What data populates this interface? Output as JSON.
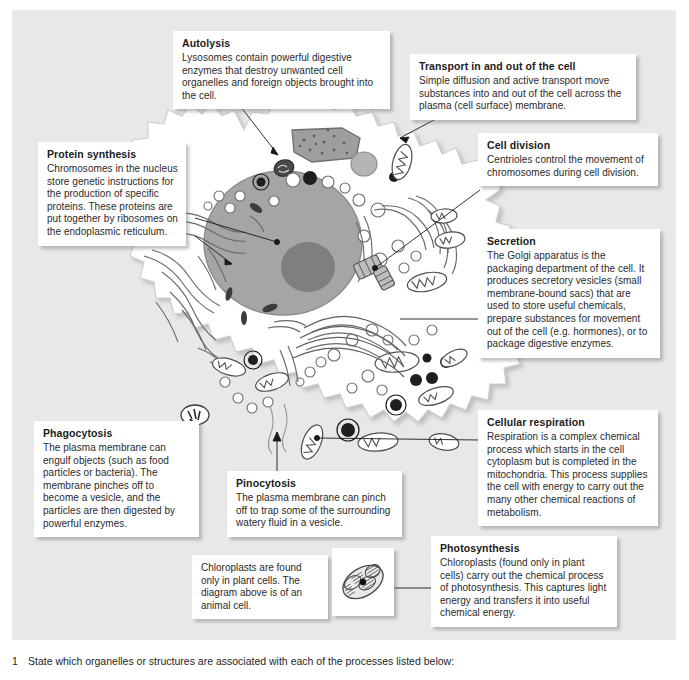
{
  "figure": {
    "background_color": "#e8e8e8",
    "callout_bg": "#ffffff",
    "cell_fill": "#ffffff",
    "nucleus_color": "#9a9a9a",
    "nucleolus_color": "#777777",
    "organelle_outline": "#4a4a4a"
  },
  "callouts": [
    {
      "id": "autolysis",
      "title": "Autolysis",
      "body": "Lysosomes contain powerful digestive enzymes that destroy unwanted cell organelles and foreign objects brought into the cell."
    },
    {
      "id": "transport",
      "title": "Transport in and out of the cell",
      "body": "Simple diffusion and active transport move substances into and out of the cell across the plasma (cell surface) membrane."
    },
    {
      "id": "protein-synthesis",
      "title": "Protein synthesis",
      "body": "Chromosomes in the nucleus store genetic instructions for the production of specific proteins. These proteins are put together by ribosomes on the endoplasmic reticulum."
    },
    {
      "id": "cell-division",
      "title": "Cell division",
      "body": "Centrioles control the movement of chromosomes during cell division."
    },
    {
      "id": "secretion",
      "title": "Secretion",
      "body": "The Golgi apparatus is the packaging department of the cell. It produces secretory vesicles (small membrane-bound sacs) that are used to store useful chemicals, prepare substances for movement out of the cell (e.g. hormones), or to package digestive enzymes."
    },
    {
      "id": "phagocytosis",
      "title": "Phagocytosis",
      "body": "The plasma membrane can engulf objects (such as food particles or bacteria). The membrane pinches off to become a vesicle, and the particles are then digested by powerful enzymes."
    },
    {
      "id": "pinocytosis",
      "title": "Pinocytosis",
      "body": "The plasma membrane can pinch off to trap some of the surrounding watery fluid in a vesicle."
    },
    {
      "id": "cellular-respiration",
      "title": "Cellular respiration",
      "body": "Respiration is a complex chemical process which starts in the cell cytoplasm but is completed in the mitochondria. This process supplies the cell with energy to carry out the many other chemical reactions of metabolism."
    },
    {
      "id": "photosynthesis",
      "title": "Photosynthesis",
      "body": "Chloroplasts (found only in plant cells) carry out the chemical process of photosynthesis. This captures light energy and transfers it into useful chemical energy."
    }
  ],
  "chloroplast_note": {
    "text": "Chloroplasts are found only in plant cells. The diagram above is of an animal cell."
  },
  "chloroplast_thumbnail": {
    "label": "chloroplast-diagram"
  },
  "question": {
    "number": "1",
    "text": "State which organelles or structures are associated with each of the processes listed below:"
  }
}
